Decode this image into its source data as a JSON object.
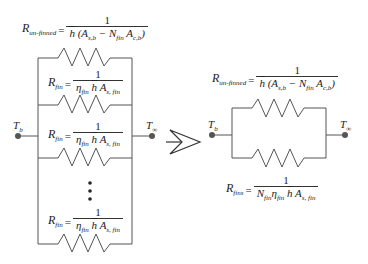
{
  "left_network": {
    "unfinned_eq": {
      "lhs": "R",
      "lhs_sub": "un-finned",
      "num": "1",
      "den_h": "h",
      "den_rest": "(A",
      "den_sub1": "s,b",
      "den_mid": " − N",
      "den_sub2": "fin",
      "den_end": " A",
      "den_sub3": "c,b",
      "den_close": ")"
    },
    "fin_eqs": [
      {
        "lhs": "R",
        "lhs_sub": "fin",
        "num": "1",
        "eta": "η",
        "eta_sub": "fin",
        "h": "h",
        "a": "A",
        "a_sub": "s, fin"
      },
      {
        "lhs": "R",
        "lhs_sub": "fin",
        "num": "1",
        "eta": "η",
        "eta_sub": "fin",
        "h": "h",
        "a": "A",
        "a_sub": "s, fin"
      },
      {
        "lhs": "R",
        "lhs_sub": "fin",
        "num": "1",
        "eta": "η",
        "eta_sub": "fin",
        "h": "h",
        "a": "A",
        "a_sub": "s, fin"
      }
    ],
    "node_left": {
      "label": "T",
      "sub": "b"
    },
    "node_right": {
      "label": "T",
      "sub": "∞"
    },
    "ellipsis": "⋮"
  },
  "arrow": {
    "icon": "chevron-right-arrow"
  },
  "right_network": {
    "unfinned_eq": {
      "lhs": "R",
      "lhs_sub": "un-finned",
      "num": "1",
      "den_h": "h",
      "den_rest": "(A",
      "den_sub1": "s,b",
      "den_mid": " − N",
      "den_sub2": "fin",
      "den_end": " A",
      "den_sub3": "c,b",
      "den_close": ")"
    },
    "fins_eq": {
      "lhs": "R",
      "lhs_sub": "fins",
      "num": "1",
      "n": "N",
      "n_sub": "fin",
      "eta": "η",
      "eta_sub": "fin",
      "h": "h",
      "a": "A",
      "a_sub": "s, fin"
    },
    "node_left": {
      "label": "T",
      "sub": "b"
    },
    "node_right": {
      "label": "T",
      "sub": "∞"
    }
  },
  "colors": {
    "line": "#444444",
    "text": "#222222",
    "background": "#ffffff"
  }
}
